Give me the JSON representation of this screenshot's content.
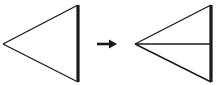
{
  "diagram": {
    "colors": {
      "stroke": "#1a1a1a",
      "background": "#ffffff"
    },
    "left_triangle": {
      "apex": [
        3,
        44
      ],
      "top": [
        78,
        5
      ],
      "bottom": [
        78,
        82
      ]
    },
    "arrow": {
      "from": [
        97,
        44
      ],
      "to": [
        116,
        44
      ],
      "direction": "right"
    },
    "right_triangle": {
      "apex": [
        135,
        44
      ],
      "top": [
        211,
        5
      ],
      "bottom": [
        211,
        82
      ],
      "bisector": [
        [
          135,
          44
        ],
        [
          211,
          44
        ]
      ]
    }
  }
}
